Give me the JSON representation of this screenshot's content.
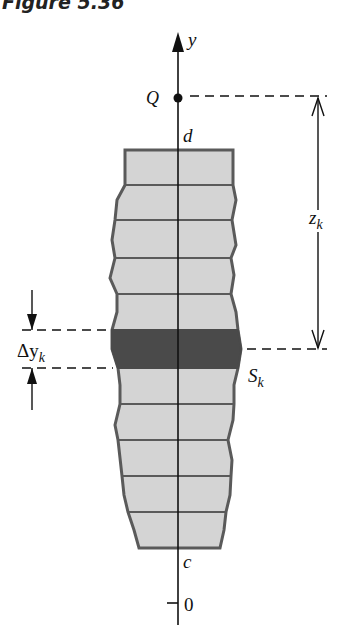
{
  "figure": {
    "title": "Figure 5.36"
  },
  "labels": {
    "axis_y": "y",
    "point_q": "Q",
    "upper_limit": "d",
    "lower_limit": "c",
    "origin": "0",
    "distance": "z",
    "distance_sub": "k",
    "strip_height": "Δy",
    "strip_height_sub": "k",
    "strip": "S",
    "strip_sub": "k"
  },
  "colors": {
    "region_fill": "#d4d4d4",
    "region_outline": "#5a5a5a",
    "strip_fill": "#4a4a4a",
    "axis": "#111111"
  }
}
